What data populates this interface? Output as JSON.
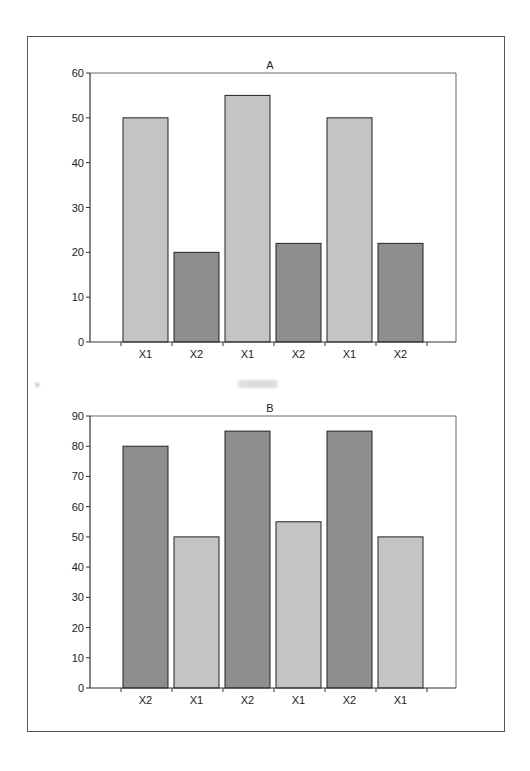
{
  "chart_data": [
    {
      "type": "bar",
      "title": "A",
      "categories": [
        "X1",
        "X2",
        "X1",
        "X2",
        "X1",
        "X2"
      ],
      "values": [
        50,
        20,
        55,
        22,
        50,
        22
      ],
      "colors": [
        "#c4c4c4",
        "#8e8e8e",
        "#c4c4c4",
        "#8e8e8e",
        "#c4c4c4",
        "#8e8e8e"
      ],
      "xlabel": "",
      "ylabel": "",
      "ylim": [
        0,
        60
      ],
      "yticks": [
        0,
        10,
        20,
        30,
        40,
        50,
        60
      ],
      "grid": false,
      "legend": null
    },
    {
      "type": "bar",
      "title": "B",
      "categories": [
        "X2",
        "X1",
        "X2",
        "X1",
        "X2",
        "X1"
      ],
      "values": [
        80,
        50,
        85,
        55,
        85,
        50
      ],
      "colors": [
        "#8e8e8e",
        "#c4c4c4",
        "#8e8e8e",
        "#c4c4c4",
        "#8e8e8e",
        "#c4c4c4"
      ],
      "xlabel": "",
      "ylabel": "",
      "ylim": [
        0,
        90
      ],
      "yticks": [
        0,
        10,
        20,
        30,
        40,
        50,
        60,
        70,
        80,
        90
      ],
      "grid": false,
      "legend": null
    }
  ],
  "colors": {
    "light_bar": "#c4c4c4",
    "dark_bar": "#8e8e8e",
    "axis": "#333333",
    "frame": "#555555"
  }
}
